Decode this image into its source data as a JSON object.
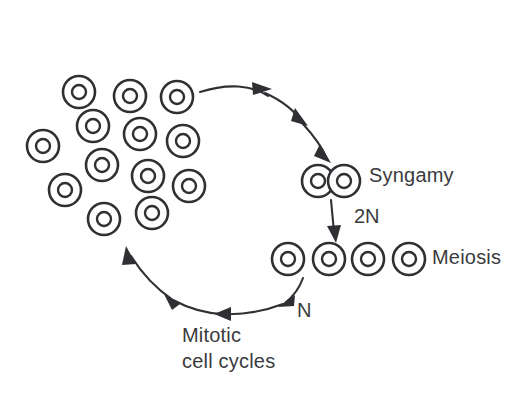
{
  "diagram": {
    "background_color": "#ffffff",
    "stroke_color": "#2f3033",
    "text_color": "#3a3b3e",
    "labels": {
      "syngamy": "Syngamy",
      "meiosis": "Meiosis",
      "diploid": "2N",
      "haploid": "N",
      "mitotic_line1": "Mitotic",
      "mitotic_line2": "cell cycles"
    },
    "stages": [
      {
        "name": "haploid-cell-population",
        "label": "",
        "cell_count": 14,
        "description": "cluster of haploid cells produced by mitotic cell cycles"
      },
      {
        "name": "syngamy-zygote",
        "label": "Syngamy",
        "cell_count": 2,
        "description": "two gametes fusing"
      },
      {
        "name": "meiosis-products",
        "label": "Meiosis",
        "cell_count": 4,
        "description": "four haploid products of meiosis"
      }
    ],
    "cluster_cells": [
      {
        "cx": 79,
        "cy": 92,
        "r_outer": 16,
        "r_inner": 7
      },
      {
        "cx": 130,
        "cy": 96,
        "r_outer": 16,
        "r_inner": 7
      },
      {
        "cx": 177,
        "cy": 97,
        "r_outer": 16,
        "r_inner": 7
      },
      {
        "cx": 93,
        "cy": 126,
        "r_outer": 16,
        "r_inner": 7
      },
      {
        "cx": 140,
        "cy": 134,
        "r_outer": 16,
        "r_inner": 7
      },
      {
        "cx": 183,
        "cy": 141,
        "r_outer": 16,
        "r_inner": 7
      },
      {
        "cx": 43,
        "cy": 146,
        "r_outer": 16,
        "r_inner": 7
      },
      {
        "cx": 102,
        "cy": 165,
        "r_outer": 16,
        "r_inner": 7
      },
      {
        "cx": 148,
        "cy": 176,
        "r_outer": 16,
        "r_inner": 7
      },
      {
        "cx": 189,
        "cy": 186,
        "r_outer": 16,
        "r_inner": 7
      },
      {
        "cx": 65,
        "cy": 190,
        "r_outer": 16,
        "r_inner": 7
      },
      {
        "cx": 104,
        "cy": 219,
        "r_outer": 16,
        "r_inner": 7
      },
      {
        "cx": 152,
        "cy": 213,
        "r_outer": 16,
        "r_inner": 7
      },
      {
        "cx": 44,
        "cy": 146,
        "r_outer": 16,
        "r_inner": 7
      }
    ],
    "zygote_cells": [
      {
        "cx": 318,
        "cy": 181,
        "r_outer": 16,
        "r_inner": 7
      },
      {
        "cx": 344,
        "cy": 181,
        "r_outer": 16,
        "r_inner": 7
      }
    ],
    "meiosis_cells": [
      {
        "cx": 288,
        "cy": 259,
        "r_outer": 16,
        "r_inner": 7
      },
      {
        "cx": 329,
        "cy": 259,
        "r_outer": 16,
        "r_inner": 7
      },
      {
        "cx": 368,
        "cy": 259,
        "r_outer": 16,
        "r_inner": 7
      },
      {
        "cx": 409,
        "cy": 259,
        "r_outer": 16,
        "r_inner": 7
      }
    ],
    "label_positions": {
      "syngamy": {
        "x": 369,
        "y": 177
      },
      "meiosis": {
        "x": 432,
        "y": 259
      },
      "diploid": {
        "x": 354,
        "y": 218
      },
      "haploid": {
        "x": 297,
        "y": 312
      },
      "mitotic_line1": {
        "x": 182,
        "y": 337
      },
      "mitotic_line2": {
        "x": 182,
        "y": 363
      }
    }
  }
}
